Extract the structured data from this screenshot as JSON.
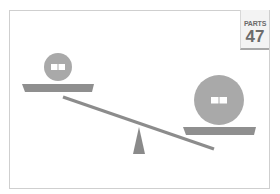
{
  "badge": {
    "label": "PARTS",
    "number": "47"
  },
  "scene": {
    "description": "Balance scale tipped toward the heavier large circle on the right",
    "left_weight": {
      "size": "small",
      "icon": "book-icon"
    },
    "right_weight": {
      "size": "large",
      "icon": "book-icon"
    }
  },
  "colors": {
    "weight_fill": "#a9a9a9",
    "tray_fill": "#8f8f8f",
    "beam_fill": "#8c8c8c",
    "fulcrum_fill": "#8a8a8a",
    "frame_border": "#cfcfcf",
    "badge_text": "#6b6b6b"
  }
}
